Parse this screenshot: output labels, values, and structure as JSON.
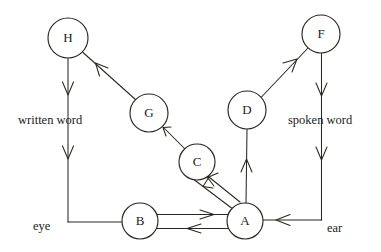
{
  "diagram": {
    "type": "node-link-schematic",
    "title": "",
    "background_color": "#ffffff",
    "ink_color": "#2a2722",
    "nodes": [
      {
        "id": "H",
        "label": "H",
        "cx": 68,
        "cy": 38,
        "r": 20
      },
      {
        "id": "F",
        "label": "F",
        "cx": 321,
        "cy": 34,
        "r": 19
      },
      {
        "id": "G",
        "label": "G",
        "cx": 149,
        "cy": 113,
        "r": 19
      },
      {
        "id": "D",
        "label": "D",
        "cx": 247,
        "cy": 110,
        "r": 19
      },
      {
        "id": "C",
        "label": "C",
        "cx": 197,
        "cy": 162,
        "r": 18
      },
      {
        "id": "B",
        "label": "B",
        "cx": 140,
        "cy": 221,
        "r": 18
      },
      {
        "id": "A",
        "label": "A",
        "cx": 245,
        "cy": 221,
        "r": 18
      }
    ],
    "captions": [
      {
        "id": "written-word",
        "text": "written word",
        "x": 18,
        "y": 124
      },
      {
        "id": "spoken-word",
        "text": "spoken word",
        "x": 288,
        "y": 124
      },
      {
        "id": "eye",
        "text": "eye",
        "x": 33,
        "y": 230
      },
      {
        "id": "ear",
        "text": "ear",
        "x": 327,
        "y": 232
      }
    ],
    "edges": [
      {
        "id": "h-to-eye",
        "from": "H",
        "to": "eye",
        "direction": "down",
        "style": "straight-vertical"
      },
      {
        "id": "eye-to-b",
        "from": "eye",
        "to": "B",
        "direction": "right",
        "style": "elbow"
      },
      {
        "id": "b-to-a",
        "from": "B",
        "to": "A",
        "direction": "right",
        "style": "parallel-pair-upper"
      },
      {
        "id": "a-to-b",
        "from": "A",
        "to": "B",
        "direction": "left",
        "style": "parallel-pair-lower"
      },
      {
        "id": "a-to-c",
        "from": "A",
        "to": "C",
        "direction": "up-left",
        "style": "parallel-pair-diagonal"
      },
      {
        "id": "c-to-a",
        "from": "C",
        "to": "A",
        "direction": "down-right",
        "style": "parallel-pair-diagonal"
      },
      {
        "id": "c-to-g",
        "from": "C",
        "to": "G",
        "direction": "up-left",
        "style": "straight-diagonal"
      },
      {
        "id": "g-to-h",
        "from": "G",
        "to": "H",
        "direction": "up-left",
        "style": "straight-diagonal"
      },
      {
        "id": "a-to-d",
        "from": "A",
        "to": "D",
        "direction": "up",
        "style": "straight-vertical"
      },
      {
        "id": "d-to-f",
        "from": "D",
        "to": "F",
        "direction": "up-right",
        "style": "straight-diagonal"
      },
      {
        "id": "f-to-ear",
        "from": "F",
        "to": "ear",
        "direction": "down",
        "style": "straight-vertical"
      },
      {
        "id": "ear-to-a",
        "from": "ear",
        "to": "A",
        "direction": "left",
        "style": "elbow"
      }
    ]
  }
}
